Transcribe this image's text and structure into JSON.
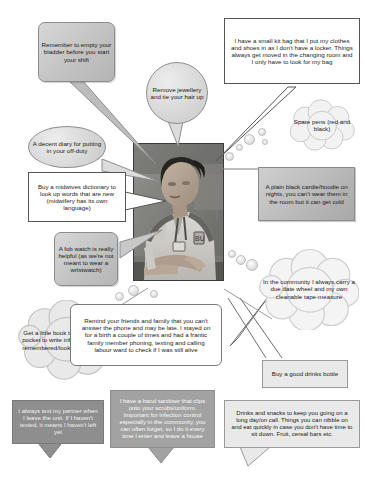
{
  "poster": {
    "title": "Midwifery student tips poster",
    "center_image_alt": "Photograph of a student midwife in uniform seated at a desk"
  },
  "bubbles": [
    {
      "id": "empty-bladder",
      "shape": "rounded-rectangle",
      "text": "Remember to empty your bladder before you start your shift"
    },
    {
      "id": "remove-jewellery",
      "shape": "oval",
      "text": "Remove jewellery and tie your hair up"
    },
    {
      "id": "kit-bag",
      "shape": "rectangle",
      "text": "I have a small kit bag that I put my clothes and shoes in as I don't have a locker.  Things always get moved in the changing room and I only have to look for my bag"
    },
    {
      "id": "spare-pens",
      "shape": "cloud",
      "text": "Spare pens (red and black)"
    },
    {
      "id": "decent-diary",
      "shape": "oval",
      "text": "A decent diary for putting in your off-duty"
    },
    {
      "id": "midwives-dictionary",
      "shape": "rectangle",
      "text": "Buy a midwives dictionary to look up words that are new (midwifery has its own language)"
    },
    {
      "id": "black-cardie",
      "shape": "shaded-box",
      "text": "A plain black cardie/hoodie on nights, you can't wear them in the room but it can get cold"
    },
    {
      "id": "fob-watch",
      "shape": "rounded-rectangle",
      "text": "A fob watch is really helpful (as we're not meant to wear a wristwatch)"
    },
    {
      "id": "due-date-wheel",
      "shape": "cloud",
      "text": "In the community I always carry a due date wheel and my own cleanable tape-measure"
    },
    {
      "id": "little-book",
      "shape": "cloud",
      "text": "Get a little book to keep in your pocket to write information to be remembered/looked up at home"
    },
    {
      "id": "remind-friends-family",
      "shape": "rounded-rectangle-white",
      "text": "Remind your friends and family that you can't answer the phone and may be late.  I stayed on for a birth a couple of times and had a frantic family member phoning, texting and calling labour ward to check if I was still alive"
    },
    {
      "id": "drinks-bottle",
      "shape": "rectangle",
      "text": "Buy a good drinks bottle"
    },
    {
      "id": "text-partner",
      "shape": "dark-box",
      "text": "I always text my partner when I leave the unit.  If I haven't texted, it means I haven't left yet"
    },
    {
      "id": "hand-sanitiser",
      "shape": "dark-box",
      "text": "I have a hand sanitiser that clips onto your scrubs/uniform.  Important for infection control especially in the community, you can often forget, so I do it every time I enter and leave a house"
    },
    {
      "id": "drinks-snacks",
      "shape": "light-grey-box",
      "text": "Drinks and snacks to keep you going on a long day/on call. Things you can nibble on and eat quickly in case you don't have time to sit down. Fruit, cereal bars etc."
    }
  ],
  "colors": {
    "page_background": "#ffffff",
    "bubble_grey": "#c2c2c2",
    "bubble_dark": "#8e8e8e",
    "outline": "#555555",
    "text_dark": "#1a1a1a",
    "text_light": "#f2f2f2"
  }
}
